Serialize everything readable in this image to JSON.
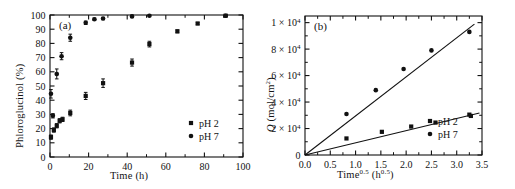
{
  "figure": {
    "background": "#ffffff",
    "ink": "#111111",
    "marker_color": "#111111"
  },
  "panels": [
    {
      "id": "a",
      "tag": "(a)",
      "xlabel": "Time (h)",
      "ylabel": "Phloroglucinol (%)",
      "xlim": [
        0,
        100
      ],
      "ylim": [
        0,
        100
      ],
      "xticks": [
        0,
        20,
        40,
        60,
        80,
        100
      ],
      "xtick_labels": [
        "0",
        "20",
        "40",
        "60",
        "80",
        "100"
      ],
      "xminor_step": 10,
      "yticks": [
        0,
        10,
        20,
        30,
        40,
        50,
        60,
        70,
        80,
        90,
        100
      ],
      "ytick_labels": [
        "0",
        "10",
        "20",
        "30",
        "40",
        "50",
        "60",
        "70",
        "80",
        "90",
        "100"
      ],
      "legend": [
        {
          "label": "pH 2",
          "marker": "square"
        },
        {
          "label": "pH 7",
          "marker": "circle"
        }
      ]
    },
    {
      "id": "b",
      "tag": "(b)",
      "xlabel_parts": {
        "base": "Time",
        "sup": "0.5",
        "unit_open": " (h",
        "unit_sup": "0.5",
        "unit_close": ")"
      },
      "ylabel_parts": {
        "sym": "Q",
        "unit": " (mol/cm",
        "unit_sup": "2",
        "unit_close": ")"
      },
      "xlim": [
        0,
        3.5
      ],
      "ylim": [
        0,
        10500
      ],
      "xticks": [
        0.0,
        0.5,
        1.0,
        1.5,
        2.0,
        2.5,
        3.0,
        3.5
      ],
      "xtick_labels": [
        "0.0",
        "0.5",
        "1.0",
        "1.5",
        "2.0",
        "2.5",
        "3.0",
        "3.5"
      ],
      "yticks": [
        0,
        2000,
        4000,
        6000,
        8000,
        10000
      ],
      "ytick_labels": [
        "0",
        "2 × 10",
        "4 × 10",
        "6 × 10",
        "8 × 10",
        "1 × 10"
      ],
      "ytick_exponent": "4",
      "legend": [
        {
          "label": "pH 2",
          "marker": "square"
        },
        {
          "label": "pH 7",
          "marker": "circle"
        }
      ]
    }
  ],
  "chart_data": [
    {
      "type": "scatter",
      "panel": "a",
      "title": "(a)",
      "xlabel": "Time (h)",
      "ylabel": "Phloroglucinol (%)",
      "xlim": [
        0,
        100
      ],
      "ylim": [
        0,
        100
      ],
      "grid": false,
      "legend_position": "lower-right",
      "errorbars": true,
      "series": [
        {
          "name": "pH 7",
          "marker": "circle",
          "x": [
            0.5,
            1.5,
            3.5,
            6.0,
            10.5,
            18.5,
            23.0,
            27.5,
            42.5,
            51.5,
            91.0
          ],
          "y": [
            44.5,
            29.0,
            58.5,
            71.0,
            84.0,
            94.5,
            97.0,
            97.5,
            99.0,
            99.5,
            99.5
          ],
          "yerr": [
            3.0,
            1.5,
            3.5,
            2.5,
            2.5,
            1.2,
            0.8,
            0.8,
            0.8,
            0.5,
            0.5
          ]
        },
        {
          "name": "pH 2",
          "marker": "square",
          "x": [
            0.5,
            2.0,
            3.5,
            5.0,
            6.5,
            10.5,
            18.5,
            27.5,
            42.5,
            51.5,
            66.0,
            76.5,
            91.0
          ],
          "y": [
            14.0,
            19.0,
            22.0,
            25.5,
            26.5,
            31.0,
            43.0,
            52.0,
            66.5,
            79.5,
            88.5,
            94.0,
            99.5
          ],
          "yerr": [
            1.5,
            1.5,
            1.5,
            1.5,
            1.5,
            2.0,
            2.5,
            3.0,
            2.5,
            2.0,
            1.0,
            0.8,
            0.5
          ]
        }
      ]
    },
    {
      "type": "scatter",
      "panel": "b",
      "title": "(b)",
      "xlabel": "Time^0.5 (h^0.5)",
      "ylabel": "Q (mol/cm^2)",
      "xlim": [
        0,
        3.5
      ],
      "ylim": [
        0,
        10500
      ],
      "grid": false,
      "legend_position": "lower-right",
      "series": [
        {
          "name": "pH 7",
          "marker": "circle",
          "x": [
            0.82,
            1.4,
            1.95,
            2.5,
            3.25
          ],
          "y": [
            3100,
            4900,
            6500,
            7900,
            9300
          ],
          "fit_line": {
            "slope": 2950,
            "intercept": 0,
            "x_start": 0.0,
            "x_end": 3.35
          }
        },
        {
          "name": "pH 2",
          "marker": "square",
          "x": [
            0.82,
            1.52,
            2.1,
            2.58,
            3.25,
            3.28
          ],
          "y": [
            1250,
            1750,
            2150,
            2450,
            3050,
            2950
          ],
          "fit_line": {
            "slope": 920,
            "intercept": 0,
            "x_start": 0.0,
            "x_end": 3.45
          }
        }
      ]
    }
  ]
}
